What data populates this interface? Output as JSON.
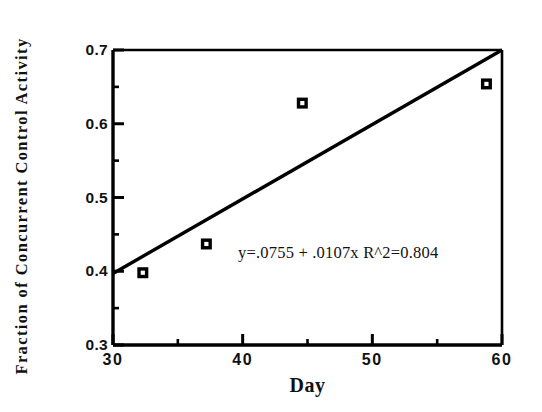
{
  "chart_data": {
    "type": "scatter",
    "title": "",
    "xlabel": "Day",
    "ylabel": "Fraction of Concurrent Control Activity",
    "xlim": [
      30,
      60
    ],
    "ylim": [
      0.3,
      0.7
    ],
    "grid": false,
    "legend": "none",
    "x_major_ticks": [
      30,
      40,
      50,
      60
    ],
    "x_minor_ticks": [
      35,
      45,
      55
    ],
    "y_major_ticks": [
      0.3,
      0.4,
      0.5,
      0.6,
      0.7
    ],
    "y_minor_ticks": [
      0.35,
      0.45,
      0.55,
      0.65
    ],
    "x_tick_labels": [
      "30",
      "40",
      "50",
      "60"
    ],
    "y_tick_labels": [
      "0.3",
      "0.4",
      "0.5",
      "0.6",
      "0.7"
    ],
    "marker_style": "open-centered-square",
    "points": [
      {
        "x": 32.3,
        "y": 0.398
      },
      {
        "x": 37.2,
        "y": 0.437
      },
      {
        "x": 44.6,
        "y": 0.628
      },
      {
        "x": 58.8,
        "y": 0.654
      }
    ],
    "series": [
      {
        "name": "data",
        "x": [
          32.3,
          37.2,
          44.6,
          58.8
        ],
        "values": [
          0.398,
          0.437,
          0.628,
          0.654
        ]
      }
    ],
    "fit": {
      "type": "linear",
      "intercept": 0.0755,
      "slope": 0.0107,
      "r_squared": 0.804,
      "x_start": 30,
      "x_end": 60,
      "y_start": 0.397,
      "y_end": 0.7
    },
    "annotations": [
      {
        "text": "y=.0755 + .0107x R^2=0.804",
        "x": 45.0,
        "y": 0.432
      }
    ],
    "colors": {
      "axis": "#000000",
      "line": "#000000",
      "marker": "#000000",
      "marker_center": "#ffffff",
      "background": "#ffffff",
      "text": "#111111"
    }
  },
  "axes": {
    "x_title": "Day",
    "y_title": "Fraction of Concurrent Control Activity"
  },
  "annotation": {
    "equation": "y=.0755 + .0107x R^2=0.804"
  }
}
